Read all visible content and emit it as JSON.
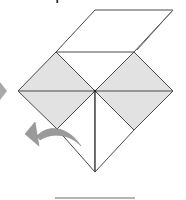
{
  "diagram": {
    "title": "Origami fold step",
    "colors": {
      "background": "#ffffff",
      "line": "#4a4a4a",
      "shade": "#e2e2e2",
      "arrow": "#9a9a9a",
      "step_arrow": "#a8a8a8",
      "rule": "#9c9c9c"
    },
    "shapes": {
      "top_flap": "95,10 173,10 134,52 56,52",
      "back_edge": "173,10 137,50",
      "left_square": "56,52 95,91 57,129 18,91",
      "right_square": "134,52 173,91 134,130 95,91",
      "lower_left_triangle": "57,129 95,91 95,172",
      "lower_right_triangle": "95,91 134,130 95,172",
      "left_horizontal": "18,91 95,91",
      "right_horizontal": "95,91 173,91",
      "center_vertical": "95,91 95,172",
      "step_arrow": "0,82 7,91 0,100"
    },
    "fold_arrow": {
      "label": "fold flap to the left",
      "direction": "left"
    },
    "bottom_rule": {
      "x1": 55,
      "x2": 135,
      "y": 198
    }
  }
}
